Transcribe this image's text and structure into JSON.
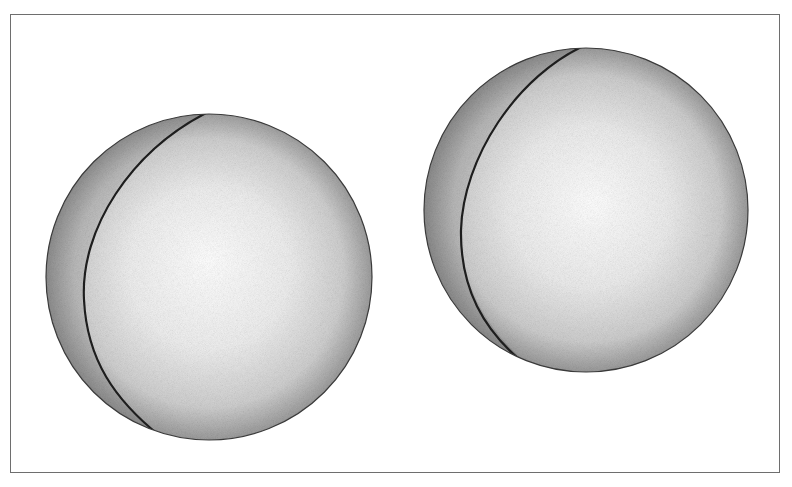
{
  "figure": {
    "colors": {
      "frame": "#6e6e6e",
      "background": "#ffffff",
      "sphere_highlight": "#ffffff",
      "sphere_mid": "#d2d2d2",
      "sphere_edge": "#5a5a5a",
      "seam": "#1e1e1e"
    },
    "objects": [
      {
        "name": "left-sphere",
        "shape": "sphere",
        "seam": true
      },
      {
        "name": "right-sphere",
        "shape": "sphere",
        "seam": true
      }
    ]
  }
}
